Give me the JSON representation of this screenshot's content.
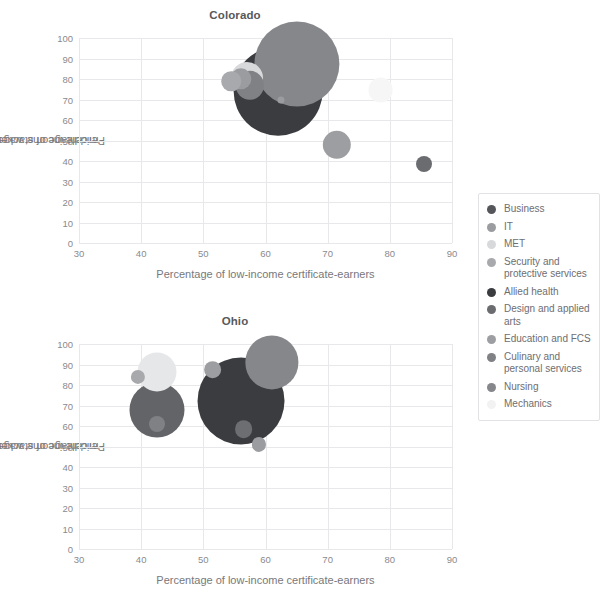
{
  "axis": {
    "x_title": "Percentage of low-income certificate-earners",
    "y_title_line1": "Percentage of stackers who earn a",
    "y_title_line2": "middle-income wage",
    "x_ticks": [
      "30",
      "40",
      "50",
      "60",
      "70",
      "80",
      "90"
    ],
    "y_ticks": [
      "0",
      "10",
      "20",
      "30",
      "40",
      "50",
      "60",
      "70",
      "80",
      "90",
      "100"
    ]
  },
  "panels": [
    {
      "title": "Colorado"
    },
    {
      "title": "Ohio"
    }
  ],
  "legend": {
    "items": [
      {
        "label": "Business",
        "color": "#55565a"
      },
      {
        "label": "IT",
        "color": "#9b9c9f"
      },
      {
        "label": "MET",
        "color": "#d8d9da"
      },
      {
        "label": "Security and protective services",
        "color": "#a8a9ac"
      },
      {
        "label": "Allied health",
        "color": "#3b3c40"
      },
      {
        "label": "Design and applied arts",
        "color": "#6b6c70"
      },
      {
        "label": "Education and FCS",
        "color": "#9d9ea1"
      },
      {
        "label": "Culinary and personal services",
        "color": "#808185"
      },
      {
        "label": "Nursing",
        "color": "#86878b"
      },
      {
        "label": "Mechanics",
        "color": "#f2f2f2"
      }
    ]
  },
  "chart_data": {
    "type": "scatter",
    "xlabel": "Percentage of low-income certificate-earners",
    "ylabel": "Percentage of stackers who earn a middle-income wage",
    "xlim": [
      30,
      90
    ],
    "ylim": [
      0,
      100
    ],
    "grid": true,
    "legend_position": "right",
    "panels": [
      {
        "name": "Colorado",
        "points": [
          {
            "series": "Business",
            "x": 62.5,
            "y": 70.0,
            "size": 2.0,
            "color": "#9b9c9f"
          },
          {
            "series": "IT",
            "x": 56.0,
            "y": 80.0,
            "size": 6.0,
            "color": "#9b9c9f"
          },
          {
            "series": "MET",
            "x": 57.0,
            "y": 80.5,
            "size": 9.0,
            "color": "#d8d9da"
          },
          {
            "series": "Security and protective services",
            "x": 54.5,
            "y": 79.0,
            "size": 5.5,
            "color": "#a8a9ac"
          },
          {
            "series": "Allied health",
            "x": 62.0,
            "y": 74.0,
            "size": 25.0,
            "color": "#3b3c40"
          },
          {
            "series": "Design and applied arts",
            "x": 85.5,
            "y": 38.5,
            "size": 4.5,
            "color": "#6b6c70"
          },
          {
            "series": "Education and FCS",
            "x": 71.5,
            "y": 48.0,
            "size": 8.0,
            "color": "#9d9ea1"
          },
          {
            "series": "Culinary and personal services",
            "x": 57.5,
            "y": 77.0,
            "size": 8.0,
            "color": "#808185"
          },
          {
            "series": "Nursing",
            "x": 65.0,
            "y": 87.5,
            "size": 24.0,
            "color": "#86878b"
          },
          {
            "series": "Mechanics",
            "x": 78.5,
            "y": 74.5,
            "size": 7.0,
            "color": "#f6f6f6"
          }
        ]
      },
      {
        "name": "Ohio",
        "points": [
          {
            "series": "Business",
            "x": 56.5,
            "y": 58.5,
            "size": 5.0,
            "color": "#6d6e72"
          },
          {
            "series": "IT",
            "x": 59.0,
            "y": 51.0,
            "size": 4.0,
            "color": "#9b9c9f"
          },
          {
            "series": "MET",
            "x": 42.5,
            "y": 86.5,
            "size": 11.0,
            "color": "#e6e7e8"
          },
          {
            "series": "Security and protective services",
            "x": 39.5,
            "y": 84.0,
            "size": 4.0,
            "color": "#a8a9ac"
          },
          {
            "series": "Allied health",
            "x": 56.0,
            "y": 72.0,
            "size": 24.5,
            "color": "#3b3c40"
          },
          {
            "series": "Design and applied arts",
            "x": 42.5,
            "y": 68.0,
            "size": 15.5,
            "color": "#636468"
          },
          {
            "series": "Education and FCS",
            "x": 51.5,
            "y": 87.5,
            "size": 5.0,
            "color": "#9d9ea1"
          },
          {
            "series": "Culinary and personal services",
            "x": 42.5,
            "y": 61.0,
            "size": 4.5,
            "color": "#808185"
          },
          {
            "series": "Nursing",
            "x": 61.0,
            "y": 91.0,
            "size": 15.0,
            "color": "#86878b"
          },
          {
            "series": "Mechanics",
            "x": 80.0,
            "y": 42.0,
            "size": 0.0,
            "color": "#fafafa"
          }
        ]
      }
    ]
  }
}
